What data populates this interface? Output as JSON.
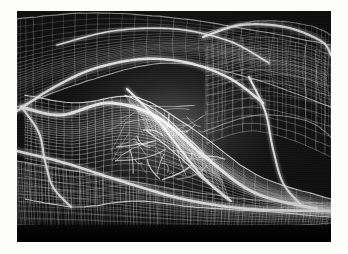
{
  "page": {
    "background_color": "#fdfdfc",
    "width": 348,
    "height": 254
  },
  "figure": {
    "x": 17,
    "y": 11,
    "width": 314,
    "height": 231,
    "background_color": "#090909",
    "line_color": "#ffffff",
    "render_style": "wireframe",
    "medium": "scanned halftone print"
  },
  "chart_data": {
    "type": "line",
    "xlabel": "",
    "ylabel": "",
    "xlim": [
      0,
      314
    ],
    "ylim": [
      0,
      231
    ],
    "grid": false,
    "legend": "none",
    "annotations": [
      "dense bright mesh cluster at image centre",
      "dark open cells upper right quadrant",
      "vertical ruled fringe along lower edge",
      "solid black band across the bottom"
    ],
    "surfaces": [
      {
        "name": "upper-left-canopy",
        "u_lines": 26,
        "v_lines": 22,
        "brightness": 0.72,
        "ridge": [
          [
            0,
            86
          ],
          [
            40,
            62
          ],
          [
            92,
            44
          ],
          [
            148,
            40
          ],
          [
            196,
            54
          ],
          [
            238,
            78
          ]
        ],
        "control": {
          "top": [
            [
              0,
              8
            ],
            [
              70,
              2
            ],
            [
              150,
              6
            ],
            [
              230,
              18
            ],
            [
              314,
              34
            ]
          ],
          "bottom": [
            [
              0,
              96
            ],
            [
              70,
              70
            ],
            [
              150,
              52
            ],
            [
              230,
              66
            ],
            [
              314,
              96
            ]
          ]
        }
      },
      {
        "name": "upper-right-shell",
        "u_lines": 20,
        "v_lines": 18,
        "brightness": 0.55,
        "ridge": [
          [
            196,
            40
          ],
          [
            238,
            30
          ],
          [
            282,
            34
          ],
          [
            314,
            48
          ]
        ],
        "control": {
          "top": [
            [
              188,
              22
            ],
            [
              240,
              10
            ],
            [
              290,
              14
            ],
            [
              314,
              24
            ]
          ],
          "bottom": [
            [
              188,
              120
            ],
            [
              240,
              104
            ],
            [
              290,
              110
            ],
            [
              314,
              126
            ]
          ]
        }
      },
      {
        "name": "central-sweep",
        "u_lines": 34,
        "v_lines": 26,
        "brightness": 1.0,
        "ridge": [
          [
            10,
            92
          ],
          [
            56,
            100
          ],
          [
            104,
            92
          ],
          [
            150,
            104
          ],
          [
            196,
            140
          ],
          [
            244,
            176
          ],
          [
            300,
            196
          ]
        ],
        "control": {
          "top": [
            [
              8,
              84
            ],
            [
              60,
              92
            ],
            [
              118,
              86
            ],
            [
              176,
              118
            ],
            [
              240,
              164
            ],
            [
              314,
              188
            ]
          ],
          "bottom": [
            [
              8,
              188
            ],
            [
              60,
              196
            ],
            [
              118,
              190
            ],
            [
              176,
              196
            ],
            [
              240,
              200
            ],
            [
              314,
              206
            ]
          ]
        }
      },
      {
        "name": "lower-field",
        "u_lines": 46,
        "v_lines": 14,
        "brightness": 0.62,
        "ridge": [
          [
            0,
            176
          ],
          [
            80,
            186
          ],
          [
            170,
            196
          ],
          [
            250,
            200
          ],
          [
            314,
            198
          ]
        ],
        "control": {
          "top": [
            [
              0,
              150
            ],
            [
              80,
              164
            ],
            [
              170,
              180
            ],
            [
              250,
              190
            ],
            [
              314,
              192
            ]
          ],
          "bottom": [
            [
              0,
              214
            ],
            [
              80,
              216
            ],
            [
              170,
              218
            ],
            [
              250,
              216
            ],
            [
              314,
              212
            ]
          ]
        }
      },
      {
        "name": "dense-core-cluster",
        "u_lines": 18,
        "v_lines": 16,
        "brightness": 1.0,
        "ridge": [
          [
            118,
            96
          ],
          [
            142,
            112
          ],
          [
            162,
            136
          ],
          [
            180,
            160
          ]
        ],
        "control": {
          "top": [
            [
              108,
              84
            ],
            [
              140,
              100
            ],
            [
              172,
              128
            ],
            [
              200,
              156
            ]
          ],
          "bottom": [
            [
              130,
              120
            ],
            [
              158,
              142
            ],
            [
              186,
              168
            ],
            [
              212,
              190
            ]
          ]
        }
      }
    ],
    "ridge_curves": [
      {
        "name": "canopy-leading-edge",
        "points": [
          [
            0,
            100
          ],
          [
            34,
            78
          ],
          [
            76,
            58
          ],
          [
            126,
            48
          ],
          [
            172,
            52
          ],
          [
            214,
            68
          ],
          [
            246,
            92
          ]
        ],
        "width": 2.4
      },
      {
        "name": "central-spine",
        "points": [
          [
            4,
            96
          ],
          [
            44,
            104
          ],
          [
            92,
            92
          ],
          [
            140,
            106
          ],
          [
            188,
            146
          ],
          [
            238,
            182
          ],
          [
            300,
            198
          ]
        ],
        "width": 3.0
      },
      {
        "name": "lower-sweep",
        "points": [
          [
            0,
            140
          ],
          [
            48,
            152
          ],
          [
            104,
            170
          ],
          [
            166,
            188
          ],
          [
            232,
            198
          ],
          [
            314,
            200
          ]
        ],
        "width": 2.6
      },
      {
        "name": "right-arch",
        "points": [
          [
            186,
            26
          ],
          [
            224,
            14
          ],
          [
            268,
            16
          ],
          [
            304,
            30
          ],
          [
            314,
            44
          ]
        ],
        "width": 2.2
      },
      {
        "name": "left-pocket",
        "points": [
          [
            6,
            98
          ],
          [
            22,
            122
          ],
          [
            28,
            150
          ],
          [
            36,
            176
          ],
          [
            54,
            196
          ]
        ],
        "width": 2.0
      },
      {
        "name": "mid-diagonal",
        "points": [
          [
            110,
            78
          ],
          [
            136,
            104
          ],
          [
            160,
            134
          ],
          [
            186,
            166
          ],
          [
            214,
            190
          ]
        ],
        "width": 2.0
      },
      {
        "name": "upper-fold",
        "points": [
          [
            40,
            34
          ],
          [
            96,
            20
          ],
          [
            158,
            18
          ],
          [
            212,
            30
          ],
          [
            252,
            52
          ]
        ],
        "width": 1.6
      },
      {
        "name": "right-descender",
        "points": [
          [
            232,
            66
          ],
          [
            248,
            100
          ],
          [
            256,
            138
          ],
          [
            266,
            172
          ],
          [
            284,
            194
          ]
        ],
        "width": 2.0
      }
    ]
  }
}
